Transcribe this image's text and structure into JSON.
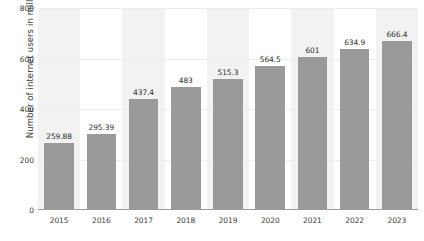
{
  "chart_data": {
    "type": "bar",
    "title": "",
    "xlabel": "",
    "ylabel": "Number of internet users in millions",
    "categories": [
      "2015",
      "2016",
      "2017",
      "2018",
      "2019",
      "2020",
      "2021",
      "2022",
      "2023"
    ],
    "values": [
      259.88,
      295.39,
      437.4,
      483,
      515.3,
      564.5,
      601,
      634.9,
      666.4
    ],
    "value_labels": [
      "259.88",
      "295.39",
      "437.4",
      "483",
      "515.3",
      "564.5",
      "601",
      "634.9",
      "666.4"
    ],
    "ylim": [
      0,
      800
    ],
    "yticks": [
      0,
      200,
      400,
      600,
      800
    ],
    "ytick_labels": [
      "0",
      "200",
      "400",
      "600",
      "800"
    ],
    "grid": true,
    "legend": null,
    "bar_color": "#9a9a9a",
    "band_color": "#f2f2f2",
    "gridline_color": "#ededed",
    "axis_color": "#9d9d9d",
    "text_color": "#3a3a3a"
  }
}
